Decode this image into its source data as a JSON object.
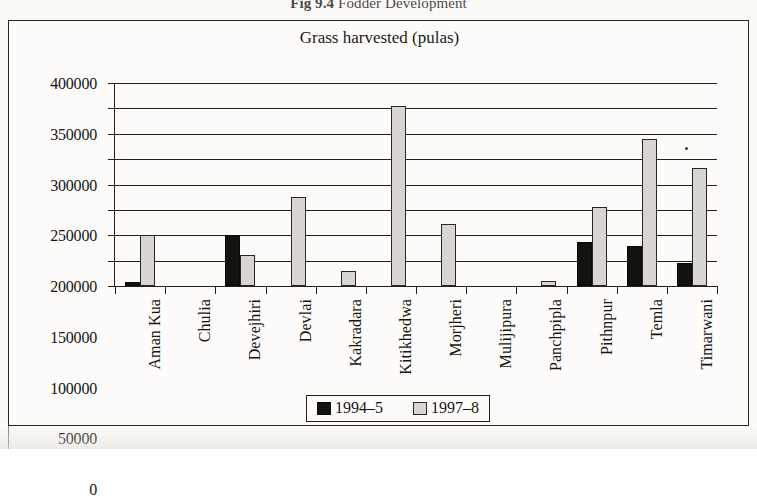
{
  "figure": {
    "number": "Fig 9.4",
    "caption": "Fodder Development"
  },
  "chart_title": "Grass harvested (pulas)",
  "legend": {
    "entries": [
      {
        "label": "1994–5",
        "color": "#14120f",
        "key": "s1994"
      },
      {
        "label": "1997–8",
        "color": "#d8d6d0",
        "key": "s1997"
      }
    ]
  },
  "axis": {
    "y_ticks": [
      "400000",
      "350000",
      "300000",
      "250000",
      "200000",
      "150000",
      "100000",
      "50000",
      "0"
    ]
  },
  "chart_data": {
    "type": "bar",
    "title": "Grass harvested (pulas)",
    "xlabel": "",
    "ylabel": "",
    "ylim": [
      0,
      400000
    ],
    "ytick_step": 50000,
    "grid": true,
    "legend_position": "bottom-center",
    "categories": [
      "Aman Kua",
      "Chulia",
      "Devejhiri",
      "Devlai",
      "Kakradara",
      "Kitikhedwa",
      "Morjheri",
      "Mulijipura",
      "Panchpipla",
      "Pithnpur",
      "Temla",
      "Timarwani"
    ],
    "series": [
      {
        "name": "1994–5",
        "color": "#14120f",
        "values": [
          8000,
          0,
          100000,
          0,
          0,
          0,
          0,
          0,
          0,
          87000,
          78000,
          45000
        ]
      },
      {
        "name": "1997–8",
        "color": "#d8d6d0",
        "values": [
          100000,
          0,
          62000,
          175000,
          30000,
          355000,
          122000,
          0,
          10000,
          155000,
          290000,
          232000
        ]
      }
    ]
  }
}
